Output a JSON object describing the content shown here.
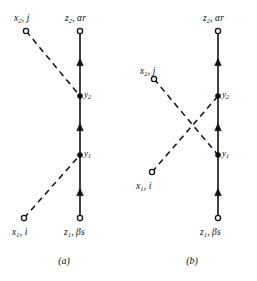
{
  "figure": {
    "background_color": "#ffffff",
    "ink_color": "#111111"
  },
  "panels": [
    {
      "id": "a",
      "caption": "(a)",
      "caption_y": 256,
      "vertex_labels": {
        "y_upper": "y",
        "y_upper_sub": "2",
        "y_lower": "y",
        "y_lower_sub": "1"
      },
      "endpoints": [
        {
          "name": "x2-j",
          "text_main": "x",
          "text_sub": "2",
          "text_tail": ", j",
          "label_x": 14,
          "label_y": 14,
          "node_x": 26,
          "node_y": 31,
          "node_type": "open"
        },
        {
          "name": "z2-alpha-r",
          "text_main": "z",
          "text_sub": "2",
          "text_tail": ", αr",
          "label_x": 65,
          "label_y": 14,
          "node_x": 80,
          "node_y": 31,
          "node_type": "open"
        },
        {
          "name": "x1-i",
          "text_main": "x",
          "text_sub": "1",
          "text_tail": ", i",
          "label_x": 12,
          "label_y": 228,
          "node_x": 24,
          "node_y": 218,
          "node_type": "open"
        },
        {
          "name": "z1-beta-s",
          "text_main": "z",
          "text_sub": "1",
          "text_tail": ", βs",
          "label_x": 64,
          "label_y": 228,
          "node_x": 80,
          "node_y": 218,
          "node_type": "open"
        }
      ],
      "solid_line": {
        "x": 80,
        "y_top": 31,
        "y_bottom": 218,
        "arrow_positions": [
          62,
          127,
          192
        ],
        "vertices": [
          {
            "name": "y2",
            "y": 96
          },
          {
            "name": "y1",
            "y": 155
          }
        ]
      },
      "dashed_lines": [
        {
          "name": "x2j-to-y2",
          "x1": 26,
          "y1": 31,
          "x2": 80,
          "y2": 96
        },
        {
          "name": "x1i-to-y1",
          "x1": 24,
          "y1": 218,
          "x2": 80,
          "y2": 155
        }
      ]
    },
    {
      "id": "b",
      "caption": "(b)",
      "caption_y": 256,
      "vertex_labels": {
        "y_upper": "y",
        "y_upper_sub": "2",
        "y_lower": "y",
        "y_lower_sub": "1"
      },
      "endpoints": [
        {
          "name": "z2-alpha-r",
          "text_main": "z",
          "text_sub": "2",
          "text_tail": ", αr",
          "label_x": 75,
          "label_y": 14,
          "node_x": 90,
          "node_y": 31,
          "node_type": "open"
        },
        {
          "name": "x2-j",
          "text_main": "x",
          "text_sub": "2",
          "text_tail": ", j",
          "label_x": 12,
          "label_y": 67,
          "node_x": 26,
          "node_y": 79,
          "node_type": "open"
        },
        {
          "name": "x1-i",
          "text_main": "x",
          "text_sub": "1",
          "text_tail": ", i",
          "label_x": 8,
          "label_y": 182,
          "node_x": 24,
          "node_y": 172,
          "node_type": "open"
        },
        {
          "name": "z1-beta-s",
          "text_main": "z",
          "text_sub": "1",
          "text_tail": ", βs",
          "label_x": 72,
          "label_y": 228,
          "node_x": 90,
          "node_y": 218,
          "node_type": "open"
        }
      ],
      "solid_line": {
        "x": 90,
        "y_top": 31,
        "y_bottom": 218,
        "arrow_positions": [
          62,
          127,
          192
        ],
        "vertices": [
          {
            "name": "y2",
            "y": 96
          },
          {
            "name": "y1",
            "y": 155
          }
        ]
      },
      "dashed_lines": [
        {
          "name": "x2j-to-y1",
          "x1": 26,
          "y1": 79,
          "x2": 90,
          "y2": 155
        },
        {
          "name": "x1i-to-y2",
          "x1": 24,
          "y1": 172,
          "x2": 90,
          "y2": 96
        }
      ]
    }
  ]
}
